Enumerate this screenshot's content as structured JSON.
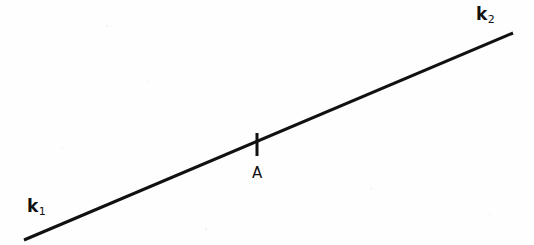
{
  "figure": {
    "width": 534,
    "height": 245,
    "background_color": "#fefefe",
    "ink_color": "#111111"
  },
  "labels": {
    "left_ray": {
      "base": "k",
      "subscript": "1",
      "x": 27,
      "y": 198
    },
    "right_ray": {
      "base": "k",
      "subscript": "2",
      "x": 476,
      "y": 6
    },
    "point": {
      "text": "A",
      "x": 252,
      "y": 166
    }
  },
  "chart_data": {
    "type": "line",
    "title": "",
    "xlabel": "",
    "ylabel": "",
    "xlim": [
      0,
      534
    ],
    "ylim": [
      245,
      0
    ],
    "grid": false,
    "legend": "none",
    "series": [
      {
        "name": "k1-k2 line",
        "x": [
          24,
          513
        ],
        "y": [
          240,
          33
        ],
        "stroke_width": 3,
        "color": "#111111"
      }
    ],
    "annotations": [
      {
        "name": "tick-mark",
        "type": "vertical-tick",
        "x": 257,
        "y_top": 133,
        "y_bottom": 156,
        "stroke_width": 3,
        "color": "#111111"
      },
      {
        "name": "k1-label",
        "text": "k₁",
        "x": 27,
        "y": 207
      },
      {
        "name": "point-label",
        "text": "A",
        "x": 258,
        "y": 174
      },
      {
        "name": "k2-label",
        "text": "k₂",
        "x": 484,
        "y": 15
      }
    ]
  }
}
